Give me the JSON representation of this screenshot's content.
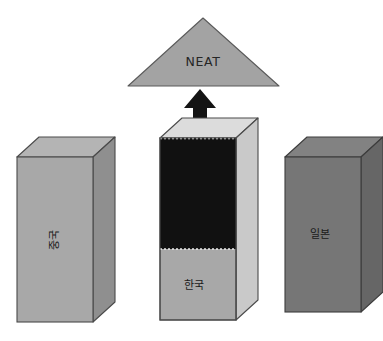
{
  "diagram": {
    "type": "three-pillar-block-diagram",
    "background_color": "#ffffff",
    "apex": {
      "shape": "triangle",
      "label": "NEAT",
      "fill_color": "#a3a3a3",
      "stroke_color": "#5a5a5a",
      "apex_point": {
        "x": 203,
        "y": 18
      },
      "base_left": {
        "x": 128,
        "y": 86
      },
      "base_right": {
        "x": 279,
        "y": 86
      },
      "label_position": {
        "x": 203,
        "y": 62
      }
    },
    "arrow": {
      "name": "upward-arrow",
      "direction": "up",
      "color": "#141414",
      "tip": {
        "x": 200,
        "y": 89
      },
      "tail_y": 126
    },
    "pillars": [
      {
        "id": "china",
        "label": "중국",
        "label_orientation": "vertical-rotated",
        "front_fill": "#a8a8a8",
        "side_fill": "#8f8f8f",
        "top_fill": "#b4b4b4",
        "stroke_color": "#4a4a4a",
        "front": {
          "x": 17,
          "y": 157,
          "width": 76,
          "height": 165
        },
        "depth_x": 22,
        "depth_y": 20,
        "fill_state": "empty",
        "fill_ratio": 0
      },
      {
        "id": "korea",
        "label": "한국",
        "label_orientation": "horizontal",
        "front_fill": "#a8a8a8",
        "side_fill": "#c9c9c9",
        "top_fill": "#dcdcdc",
        "stroke_color": "#4a4a4a",
        "front": {
          "x": 160,
          "y": 138,
          "width": 76,
          "height": 182
        },
        "depth_x": 22,
        "depth_y": 20,
        "fill_state": "filled",
        "fill_color": "#111111",
        "fill_ratio": 0.61,
        "fill_top_y": 138,
        "fill_bottom_y": 249
      },
      {
        "id": "japan",
        "label": "일본",
        "label_orientation": "horizontal",
        "front_fill": "#767676",
        "side_fill": "#666666",
        "top_fill": "#828282",
        "stroke_color": "#3c3c3c",
        "front": {
          "x": 285,
          "y": 157,
          "width": 76,
          "height": 155
        },
        "depth_x": 22,
        "depth_y": 20,
        "fill_state": "empty",
        "fill_ratio": 0
      }
    ]
  }
}
